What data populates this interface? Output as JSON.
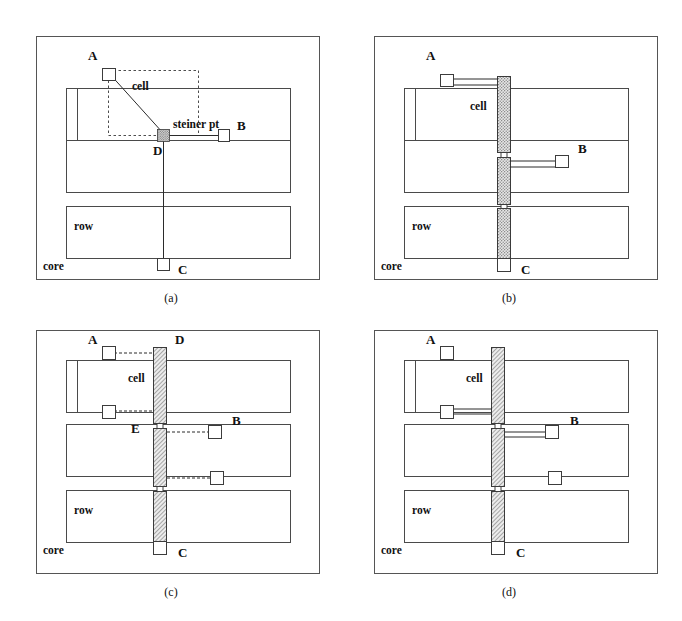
{
  "figure": {
    "background_color": "#ffffff",
    "line_color": "#3a3a3a",
    "feedthrough_fill": "#a9a9a9",
    "steiner_fill": "#9a9a9a"
  },
  "panels": [
    {
      "id": "a",
      "caption": "(a)",
      "core_label": "core",
      "cell_label": "cell",
      "row_label": "row",
      "terminals": [
        {
          "name": "A",
          "label": "A"
        },
        {
          "name": "B",
          "label": "B"
        },
        {
          "name": "C",
          "label": "C"
        },
        {
          "name": "D",
          "label": "D"
        }
      ],
      "annotations": [
        {
          "name": "steiner-point",
          "label": "steiner pt"
        }
      ],
      "description": "Initial net with steiner point and bounding box"
    },
    {
      "id": "b",
      "caption": "(b)",
      "core_label": "core",
      "cell_label": "cell",
      "row_label": "row",
      "terminals": [
        {
          "name": "A",
          "label": "A"
        },
        {
          "name": "B",
          "label": "B"
        },
        {
          "name": "C",
          "label": "C"
        }
      ],
      "annotations": [],
      "description": "Feedthrough cells inserted vertically through all rows"
    },
    {
      "id": "c",
      "caption": "(c)",
      "core_label": "core",
      "cell_label": "cell",
      "row_label": "row",
      "terminals": [
        {
          "name": "A",
          "label": "A"
        },
        {
          "name": "B",
          "label": "B"
        },
        {
          "name": "C",
          "label": "C"
        },
        {
          "name": "D",
          "label": "D"
        },
        {
          "name": "E",
          "label": "E"
        }
      ],
      "annotations": [],
      "description": "Feedthrough pins D and E connected by dashed wires"
    },
    {
      "id": "d",
      "caption": "(d)",
      "core_label": "core",
      "cell_label": "cell",
      "row_label": "row",
      "terminals": [
        {
          "name": "A",
          "label": "A"
        },
        {
          "name": "B",
          "label": "B"
        },
        {
          "name": "C",
          "label": "C"
        }
      ],
      "annotations": [],
      "description": "Final routed net with solid wires to feedthrough pins"
    }
  ]
}
